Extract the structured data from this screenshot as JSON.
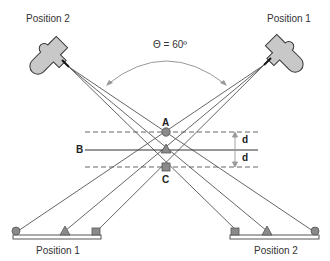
{
  "labels": {
    "camera_left": "Position 2",
    "camera_right": "Position 1",
    "angle": "Θ = 60º",
    "point_a": "A",
    "point_b": "B",
    "point_c": "C",
    "d_upper": "d",
    "d_lower": "d",
    "detector_left": "Position 1",
    "detector_right": "Position 2"
  },
  "colors": {
    "camera_fill": "#c8c8c8",
    "marker_fill": "#8a8a8a",
    "line": "#444444",
    "dashed": "#555555",
    "arc": "#999999"
  },
  "markers": {
    "A": "circle",
    "B": "triangle",
    "C": "square"
  }
}
